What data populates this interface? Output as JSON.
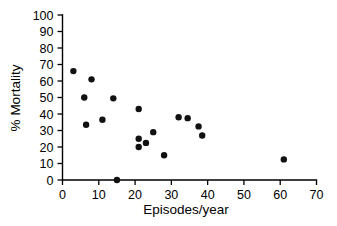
{
  "chart_data": {
    "type": "scatter",
    "title": "",
    "xlabel": "Episodes/year",
    "ylabel": "% Mortality",
    "xlim": [
      0,
      70
    ],
    "ylim": [
      0,
      100
    ],
    "xticks": [
      0,
      10,
      20,
      30,
      40,
      50,
      60,
      70
    ],
    "yticks": [
      0,
      10,
      20,
      30,
      40,
      50,
      60,
      70,
      80,
      90,
      100
    ],
    "xtick_labels": [
      "0",
      "10",
      "20",
      "30",
      "40",
      "50",
      "60",
      "70"
    ],
    "ytick_labels": [
      "0",
      "10",
      "20",
      "30",
      "40",
      "50",
      "60",
      "70",
      "80",
      "90",
      "100"
    ],
    "grid": false,
    "legend": false,
    "marker": "filled-circle",
    "marker_color": "#111111",
    "points": [
      {
        "x": 3.0,
        "y": 66.0
      },
      {
        "x": 6.0,
        "y": 50.0
      },
      {
        "x": 6.5,
        "y": 33.5
      },
      {
        "x": 8.0,
        "y": 61.0
      },
      {
        "x": 11.0,
        "y": 36.5
      },
      {
        "x": 14.0,
        "y": 49.5
      },
      {
        "x": 15.0,
        "y": 0.0
      },
      {
        "x": 21.0,
        "y": 43.0
      },
      {
        "x": 21.0,
        "y": 25.0
      },
      {
        "x": 21.0,
        "y": 20.0
      },
      {
        "x": 23.0,
        "y": 22.5
      },
      {
        "x": 25.0,
        "y": 29.0
      },
      {
        "x": 28.0,
        "y": 15.0
      },
      {
        "x": 32.0,
        "y": 38.0
      },
      {
        "x": 34.5,
        "y": 37.5
      },
      {
        "x": 37.5,
        "y": 32.5
      },
      {
        "x": 38.5,
        "y": 27.0
      },
      {
        "x": 61.0,
        "y": 12.5
      }
    ]
  }
}
